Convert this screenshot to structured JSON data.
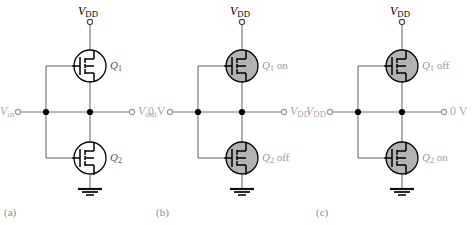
{
  "figure": {
    "type": "circuit-diagram",
    "colors": {
      "wire": "#6f6f6f",
      "device_outline": "#000000",
      "device_fill_off": "#ffffff",
      "device_fill_shaded": "#b3b3b3",
      "node_dot": "#000000",
      "supply_label": "#000000",
      "signal_label": "#a8a8a8",
      "caption": "#8c8c8c"
    }
  },
  "panels": [
    {
      "caption": "(a)",
      "supply_label_v": "V",
      "supply_label_sub": "DD",
      "input_label_v": "V",
      "input_label_sub": "in",
      "input_is_italic": true,
      "output_label_v": "V",
      "output_label_sub": "out",
      "output_is_italic": true,
      "top_device": {
        "name_q": "Q",
        "name_sub": "1",
        "state": "",
        "shaded": false
      },
      "bottom_device": {
        "name_q": "Q",
        "name_sub": "2",
        "state": "",
        "shaded": false
      }
    },
    {
      "caption": "(b)",
      "supply_label_v": "V",
      "supply_label_sub": "DD",
      "input_label_v": "0 V",
      "input_label_sub": "",
      "input_is_italic": false,
      "output_label_v": "V",
      "output_label_sub": "DD",
      "output_is_italic": true,
      "top_device": {
        "name_q": "Q",
        "name_sub": "1",
        "state": "on",
        "shaded": true
      },
      "bottom_device": {
        "name_q": "Q",
        "name_sub": "2",
        "state": "off",
        "shaded": true
      }
    },
    {
      "caption": "(c)",
      "supply_label_v": "V",
      "supply_label_sub": "DD",
      "input_label_v": "V",
      "input_label_sub": "DD",
      "input_is_italic": true,
      "output_label_v": "0 V",
      "output_label_sub": "",
      "output_is_italic": false,
      "top_device": {
        "name_q": "Q",
        "name_sub": "1",
        "state": "off",
        "shaded": true
      },
      "bottom_device": {
        "name_q": "Q",
        "name_sub": "2",
        "state": "on",
        "shaded": true
      }
    }
  ]
}
